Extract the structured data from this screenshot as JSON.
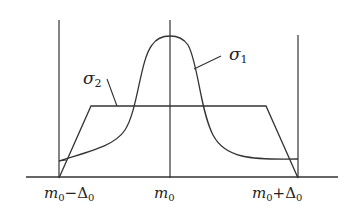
{
  "diagram": {
    "title": "",
    "curves": {
      "sigma1": {
        "label": "σ",
        "subscript": "1",
        "shape": "bell-peak"
      },
      "sigma2": {
        "label": "σ",
        "subscript": "2",
        "shape": "trapezoid"
      }
    },
    "axis_labels": {
      "left": {
        "m": "m",
        "sub0": "0",
        "op": "−",
        "delta": "Δ",
        "subd": "0"
      },
      "center": {
        "m": "m",
        "sub0": "0"
      },
      "right": {
        "m": "m",
        "sub0": "0",
        "op": "+",
        "delta": "Δ",
        "subd": "0"
      }
    },
    "line_color": "#333333"
  }
}
